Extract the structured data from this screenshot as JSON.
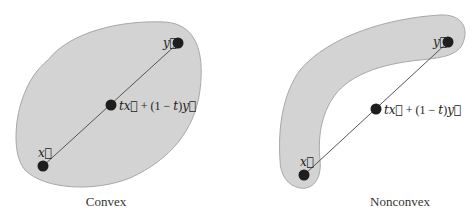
{
  "figures": [
    {
      "id": "convex",
      "caption": "Convex",
      "fill_color": "#d3d3d3",
      "stroke_color": "#a8a8a8",
      "points": {
        "x": {
          "label": "x⃗",
          "cx": 43,
          "cy": 166
        },
        "y": {
          "label": "y⃗",
          "cx": 178,
          "cy": 43
        },
        "mid": {
          "cx": 111,
          "cy": 105
        }
      }
    },
    {
      "id": "nonconvex",
      "caption": "Nonconvex",
      "fill_color": "#d3d3d3",
      "stroke_color": "#a8a8a8",
      "points": {
        "x": {
          "label": "x⃗",
          "cx": 304,
          "cy": 175
        },
        "y": {
          "label": "y⃗",
          "cx": 448,
          "cy": 42
        },
        "mid": {
          "cx": 376,
          "cy": 109
        }
      }
    }
  ],
  "labels": {
    "combo_t": "t",
    "combo_x": "x⃗",
    "combo_plus": " + (1 − ",
    "combo_t2": "t",
    "combo_close": ")",
    "combo_y": "y⃗",
    "x_vec": "x⃗",
    "y_vec": "y⃗"
  }
}
